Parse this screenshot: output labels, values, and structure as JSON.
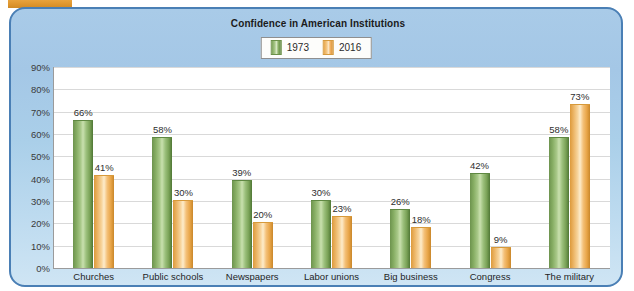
{
  "artifact": {
    "name": "orange-scan-strip"
  },
  "chart_data": {
    "type": "bar",
    "title": "Confidence in American Institutions",
    "xlabel": "",
    "ylabel": "",
    "ylim": [
      0,
      90
    ],
    "ytick_labels": [
      "90%",
      "80%",
      "70%",
      "60%",
      "50%",
      "40%",
      "30%",
      "20%",
      "10%",
      "0%"
    ],
    "ytick_values": [
      90,
      80,
      70,
      60,
      50,
      40,
      30,
      20,
      10,
      0
    ],
    "grid": true,
    "legend_position": "top-center",
    "categories": [
      "Churches",
      "Public schools",
      "Newspapers",
      "Labor unions",
      "Big business",
      "Congress",
      "The military"
    ],
    "series": [
      {
        "name": "1973",
        "color": "#7aa257",
        "values": [
          66,
          58,
          39,
          30,
          26,
          42,
          58
        ],
        "value_labels": [
          "66%",
          "58%",
          "39%",
          "30%",
          "26%",
          "42%",
          "58%"
        ]
      },
      {
        "name": "2016",
        "color": "#f0b264",
        "values": [
          41,
          30,
          20,
          23,
          18,
          9,
          73
        ],
        "value_labels": [
          "41%",
          "30%",
          "20%",
          "23%",
          "18%",
          "9%",
          "73%"
        ]
      }
    ]
  }
}
